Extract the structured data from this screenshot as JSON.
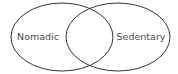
{
  "diagram": {
    "type": "venn",
    "background": "#ffffff",
    "stroke_color": "#333333",
    "text_color": "#4a4a4a",
    "sets": [
      {
        "label": "Nomadic",
        "cx": 62,
        "cy": 37,
        "rx": 51,
        "ry": 34,
        "label_x": 38,
        "label_y": 40
      },
      {
        "label": "Sedentary",
        "cx": 118,
        "cy": 37,
        "rx": 52,
        "ry": 34,
        "label_x": 141,
        "label_y": 40
      }
    ],
    "intersection_label": ""
  }
}
